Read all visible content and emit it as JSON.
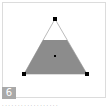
{
  "tile": {
    "badge_number": "6",
    "caption": "· · · · · · · · · · · · · · · · · ·"
  },
  "shape": {
    "name": "truncated-triangle",
    "fill_color": "#8c8c8c",
    "outline_color": "#999999",
    "handle_color": "#000000"
  }
}
